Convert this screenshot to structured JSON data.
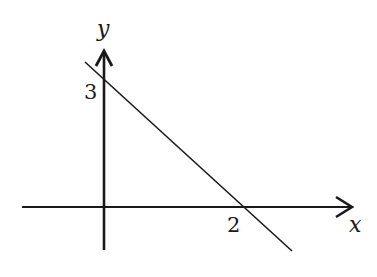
{
  "diagram": {
    "type": "coordinate-graph",
    "axes": {
      "x_label": "x",
      "y_label": "y"
    },
    "line": {
      "description": "straight line with negative slope",
      "y_intercept": 3,
      "x_intercept": 2
    },
    "tick_labels": {
      "y_intercept_label": "3",
      "x_intercept_label": "2"
    },
    "colors": {
      "stroke": "#1a1a1a",
      "background": "#ffffff"
    }
  }
}
